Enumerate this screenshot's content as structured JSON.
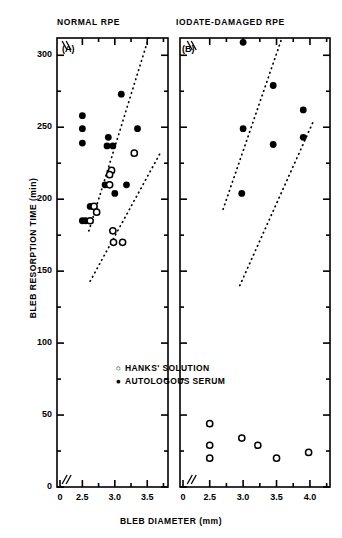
{
  "figure": {
    "y_axis_label": "BLEB RESORPTION TIME  (min)",
    "x_axis_label": "BLEB DIAMETER  (mm)"
  },
  "panels": {
    "a": {
      "title": "NORMAL RPE",
      "tag": "(A)"
    },
    "b": {
      "title": "IODATE-DAMAGED RPE",
      "tag": "(B)"
    }
  },
  "legend": {
    "items": [
      {
        "marker": "open-circle",
        "label": "HANKS' SOLUTION"
      },
      {
        "marker": "filled-circle",
        "label": "AUTOLOGOUS SERUM"
      }
    ]
  },
  "axis_ticks": {
    "y": [
      "0",
      "50",
      "100",
      "150",
      "200",
      "250",
      "300"
    ],
    "x_panel_a": [
      "0",
      "2.5",
      "3.0",
      "3.5"
    ],
    "x_panel_b": [
      "0",
      "2.5",
      "3.0",
      "3.5",
      "4.0"
    ]
  },
  "chart_data": {
    "type": "scatter",
    "xlabel": "BLEB DIAMETER  (mm)",
    "ylabel": "BLEB RESORPTION TIME  (min)",
    "ylim": [
      0,
      312
    ],
    "yticks": [
      0,
      50,
      100,
      150,
      200,
      250,
      300
    ],
    "yticks_minor": [
      25,
      75,
      125,
      175,
      225,
      275
    ],
    "grid": false,
    "axis_break_x": true,
    "legend_position": "lower-center-left-panel",
    "panels": [
      {
        "id": "A",
        "title": "NORMAL RPE",
        "tag": "(A)",
        "xlim": [
          2.28,
          3.82
        ],
        "xticks": [
          2.5,
          3.0,
          3.5
        ],
        "xticks_minor": [
          2.75,
          3.25,
          3.75
        ],
        "series": [
          {
            "name": "AUTOLOGOUS SERUM",
            "marker": "filled-circle",
            "points": [
              {
                "x": 2.5,
                "y": 258
              },
              {
                "x": 2.5,
                "y": 249
              },
              {
                "x": 2.5,
                "y": 239
              },
              {
                "x": 2.5,
                "y": 185
              },
              {
                "x": 2.55,
                "y": 185
              },
              {
                "x": 2.62,
                "y": 195
              },
              {
                "x": 2.9,
                "y": 243
              },
              {
                "x": 2.88,
                "y": 237
              },
              {
                "x": 2.97,
                "y": 237
              },
              {
                "x": 2.85,
                "y": 210
              },
              {
                "x": 3.0,
                "y": 204
              },
              {
                "x": 3.1,
                "y": 273
              },
              {
                "x": 3.18,
                "y": 210
              },
              {
                "x": 3.35,
                "y": 249
              }
            ]
          },
          {
            "name": "HANKS' SOLUTION",
            "marker": "open-circle",
            "points": [
              {
                "x": 2.62,
                "y": 185
              },
              {
                "x": 2.68,
                "y": 195
              },
              {
                "x": 2.72,
                "y": 191
              },
              {
                "x": 2.92,
                "y": 210
              },
              {
                "x": 2.95,
                "y": 220
              },
              {
                "x": 2.92,
                "y": 217
              },
              {
                "x": 2.97,
                "y": 178
              },
              {
                "x": 2.98,
                "y": 170
              },
              {
                "x": 3.12,
                "y": 170
              },
              {
                "x": 3.3,
                "y": 232
              }
            ]
          }
        ],
        "envelope_lines": [
          {
            "style": "dotted",
            "x1": 2.6,
            "y1": 178,
            "x2": 3.52,
            "y2": 312
          },
          {
            "style": "dotted",
            "x1": 2.62,
            "y1": 143,
            "x2": 3.7,
            "y2": 232
          }
        ]
      },
      {
        "id": "B",
        "title": "IODATE-DAMAGED RPE",
        "tag": "(B)",
        "xlim": [
          2.28,
          4.3
        ],
        "xticks": [
          2.5,
          3.0,
          3.5,
          4.0
        ],
        "xticks_minor": [
          2.75,
          3.25,
          3.75,
          4.25
        ],
        "series": [
          {
            "name": "AUTOLOGOUS SERUM",
            "marker": "filled-circle",
            "points": [
              {
                "x": 3.0,
                "y": 309
              },
              {
                "x": 3.45,
                "y": 279
              },
              {
                "x": 3.9,
                "y": 262
              },
              {
                "x": 3.9,
                "y": 243
              },
              {
                "x": 3.45,
                "y": 238
              },
              {
                "x": 3.0,
                "y": 249
              },
              {
                "x": 2.98,
                "y": 204
              }
            ]
          },
          {
            "name": "HANKS' SOLUTION",
            "marker": "open-circle",
            "points": [
              {
                "x": 2.5,
                "y": 44
              },
              {
                "x": 2.5,
                "y": 29
              },
              {
                "x": 2.5,
                "y": 20
              },
              {
                "x": 2.98,
                "y": 34
              },
              {
                "x": 3.22,
                "y": 29
              },
              {
                "x": 3.5,
                "y": 20
              },
              {
                "x": 3.98,
                "y": 24
              }
            ]
          }
        ],
        "envelope_lines": [
          {
            "style": "dotted",
            "x1": 2.7,
            "y1": 193,
            "x2": 3.58,
            "y2": 312
          },
          {
            "style": "dotted",
            "x1": 2.95,
            "y1": 140,
            "x2": 4.05,
            "y2": 254
          }
        ]
      }
    ]
  }
}
